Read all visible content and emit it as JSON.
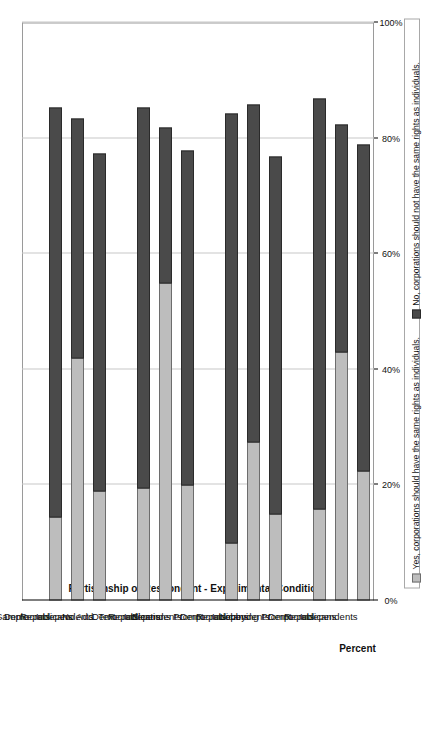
{
  "chart_data": {
    "type": "bar",
    "subtype": "stacked-bar",
    "orientation": "vertical-bars-on-rotated-page",
    "title": "",
    "xlabel": "Partisanship of Respondent - Experimental Condition",
    "ylabel": "Percent",
    "ylim": [
      0,
      100
    ],
    "ytick_labels": [
      "0%",
      "20%",
      "40%",
      "60%",
      "80%",
      "100%"
    ],
    "ytick_values": [
      0,
      20,
      40,
      60,
      80,
      100
    ],
    "grid": true,
    "legend_position": "right",
    "legend": [
      "Yes, corporations should have the same rights as individuals.",
      "No, corporations should not have the same rights as individuals."
    ],
    "series": [
      {
        "name": "Yes, corporations should have the same rights as individuals.",
        "color": "#bdbdbd",
        "values": [
          null,
          14.5,
          42.0,
          19.0,
          null,
          19.5,
          55.0,
          20.0,
          null,
          10.0,
          27.5,
          15.0,
          null,
          16.0,
          43.0,
          22.5
        ]
      },
      {
        "name": "No, corporations should not have the same rights as individuals.",
        "color": "#4a4a4a",
        "values": [
          null,
          71.0,
          41.5,
          58.5,
          null,
          66.0,
          27.0,
          58.0,
          null,
          74.5,
          58.5,
          62.0,
          null,
          71.0,
          39.5,
          56.5
        ]
      }
    ],
    "totals": [
      null,
      85.5,
      83.5,
      77.5,
      null,
      85.5,
      82.0,
      78.0,
      null,
      84.5,
      86.0,
      77.0,
      null,
      87.0,
      82.5,
      79.0
    ],
    "categories": [
      "Full Sample",
      "Democrats",
      "Republicans",
      "Independents",
      "No Add. Text",
      "Democrats",
      "Republicans",
      "Independents",
      "Elections Prompt",
      "Democrats",
      "Republicans",
      "Independents",
      "Lobbying Prompt",
      "Democrats",
      "Republicans",
      "Independents"
    ],
    "group_headers": [
      "Full Sample",
      "No Add. Text",
      "Elections Prompt",
      "Lobbying Prompt"
    ]
  },
  "colors": {
    "yes": "#bdbdbd",
    "no": "#4a4a4a",
    "grid": "#c8c8c8",
    "axis": "#000000",
    "frame": "#9a9a9a"
  }
}
